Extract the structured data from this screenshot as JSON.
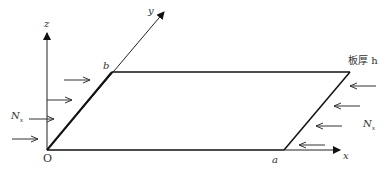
{
  "diagram": {
    "type": "plate-under-uniaxial-compression",
    "axes": {
      "x": "x",
      "y": "y",
      "z": "z",
      "origin": "O"
    },
    "dimensions": {
      "a": "a",
      "b": "b"
    },
    "thickness_label": "板厚 h",
    "load_left": "N",
    "load_left_sub": "x",
    "load_right": "N",
    "load_right_sub": "x"
  }
}
